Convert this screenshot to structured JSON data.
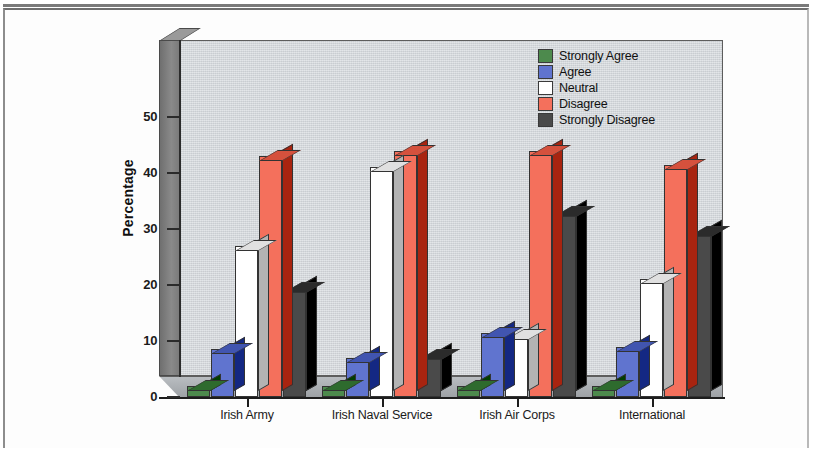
{
  "chart_data": {
    "type": "bar",
    "title": "",
    "xlabel": "",
    "ylabel": "Percentage",
    "ylim": [
      0,
      55
    ],
    "yticks": [
      0,
      10,
      20,
      30,
      40,
      50
    ],
    "grid": false,
    "legend_position": "top-right",
    "style": "3d-clustered-column",
    "categories": [
      "Irish Army",
      "Irish Naval Service",
      "Irish Air Corps",
      "International"
    ],
    "series": [
      {
        "name": "Strongly Agree",
        "color": "#4d8a4d",
        "values": [
          2,
          2,
          2,
          2
        ]
      },
      {
        "name": "Agree",
        "color": "#6074cf",
        "values": [
          8.5,
          7,
          11.5,
          9
        ]
      },
      {
        "name": "Neutral",
        "color": "#ffffff",
        "values": [
          27,
          41,
          11,
          21
        ]
      },
      {
        "name": "Disagree",
        "color": "#f4705c",
        "values": [
          43,
          44,
          44,
          41.5
        ]
      },
      {
        "name": "Strongly Disagree",
        "color": "#4a4a4a",
        "values": [
          19.5,
          7.5,
          33,
          29.5
        ]
      }
    ]
  },
  "legend": {
    "items": [
      {
        "label": "Strongly Agree"
      },
      {
        "label": "Agree"
      },
      {
        "label": "Neutral"
      },
      {
        "label": "Disagree"
      },
      {
        "label": "Strongly Disagree"
      }
    ]
  },
  "axes": {
    "y_title": "Percentage",
    "y_tick_labels": [
      "0",
      "10",
      "20",
      "30",
      "40",
      "50"
    ],
    "x_tick_labels": [
      "Irish Army",
      "Irish Naval Service",
      "Irish Air Corps",
      "International"
    ]
  }
}
